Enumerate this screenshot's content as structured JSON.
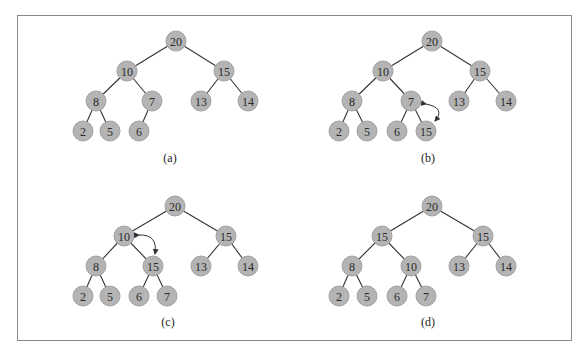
{
  "figure": {
    "panels": [
      {
        "label": "(a)",
        "nodes": [
          {
            "id": "r",
            "value": "20",
            "x": 176,
            "y": 41
          },
          {
            "id": "l",
            "value": "10",
            "x": 127,
            "y": 71
          },
          {
            "id": "r2",
            "value": "15",
            "x": 224,
            "y": 71
          },
          {
            "id": "ll",
            "value": "8",
            "x": 96,
            "y": 101
          },
          {
            "id": "lr",
            "value": "7",
            "x": 152,
            "y": 101
          },
          {
            "id": "rl",
            "value": "13",
            "x": 201,
            "y": 101
          },
          {
            "id": "rr",
            "value": "14",
            "x": 248,
            "y": 101
          },
          {
            "id": "lll",
            "value": "2",
            "x": 83,
            "y": 131
          },
          {
            "id": "llr",
            "value": "5",
            "x": 110,
            "y": 131
          },
          {
            "id": "lrl",
            "value": "6",
            "x": 139,
            "y": 131
          }
        ],
        "edges": [
          [
            "r",
            "l"
          ],
          [
            "r",
            "r2"
          ],
          [
            "l",
            "ll"
          ],
          [
            "l",
            "lr"
          ],
          [
            "r2",
            "rl"
          ],
          [
            "r2",
            "rr"
          ],
          [
            "ll",
            "lll"
          ],
          [
            "ll",
            "llr"
          ],
          [
            "lr",
            "lrl"
          ]
        ],
        "caption_pos": {
          "x": 170,
          "y": 162
        },
        "swap_arrow": null
      },
      {
        "label": "(b)",
        "nodes": [
          {
            "id": "r",
            "value": "20",
            "x": 432,
            "y": 41
          },
          {
            "id": "l",
            "value": "10",
            "x": 383,
            "y": 71
          },
          {
            "id": "r2",
            "value": "15",
            "x": 480,
            "y": 71
          },
          {
            "id": "ll",
            "value": "8",
            "x": 352,
            "y": 101
          },
          {
            "id": "lr",
            "value": "7",
            "x": 411,
            "y": 101
          },
          {
            "id": "rl",
            "value": "13",
            "x": 459,
            "y": 101
          },
          {
            "id": "rr",
            "value": "14",
            "x": 506,
            "y": 101
          },
          {
            "id": "lll",
            "value": "2",
            "x": 339,
            "y": 131
          },
          {
            "id": "llr",
            "value": "5",
            "x": 367,
            "y": 131
          },
          {
            "id": "lrl",
            "value": "6",
            "x": 397,
            "y": 131
          },
          {
            "id": "lrr",
            "value": "15",
            "x": 426,
            "y": 131
          }
        ],
        "edges": [
          [
            "r",
            "l"
          ],
          [
            "r",
            "r2"
          ],
          [
            "l",
            "ll"
          ],
          [
            "l",
            "lr"
          ],
          [
            "r2",
            "rl"
          ],
          [
            "r2",
            "rr"
          ],
          [
            "ll",
            "lll"
          ],
          [
            "ll",
            "llr"
          ],
          [
            "lr",
            "lrl"
          ],
          [
            "lr",
            "lrr"
          ]
        ],
        "caption_pos": {
          "x": 428,
          "y": 162
        },
        "swap_arrow": {
          "x1": 426,
          "y1": 104,
          "x2": 435,
          "y2": 121,
          "cx": 446,
          "cy": 108
        }
      },
      {
        "label": "(c)",
        "nodes": [
          {
            "id": "r",
            "value": "20",
            "x": 175,
            "y": 206
          },
          {
            "id": "l",
            "value": "10",
            "x": 124,
            "y": 236
          },
          {
            "id": "r2",
            "value": "15",
            "x": 226,
            "y": 236
          },
          {
            "id": "ll",
            "value": "8",
            "x": 96,
            "y": 266
          },
          {
            "id": "lr",
            "value": "15",
            "x": 153,
            "y": 266
          },
          {
            "id": "rl",
            "value": "13",
            "x": 201,
            "y": 266
          },
          {
            "id": "rr",
            "value": "14",
            "x": 248,
            "y": 266
          },
          {
            "id": "lll",
            "value": "2",
            "x": 83,
            "y": 296
          },
          {
            "id": "llr",
            "value": "5",
            "x": 110,
            "y": 296
          },
          {
            "id": "lrl",
            "value": "6",
            "x": 139,
            "y": 296
          },
          {
            "id": "lrr",
            "value": "7",
            "x": 167,
            "y": 296
          }
        ],
        "edges": [
          [
            "r",
            "l"
          ],
          [
            "r",
            "r2"
          ],
          [
            "l",
            "ll"
          ],
          [
            "l",
            "lr"
          ],
          [
            "r2",
            "rl"
          ],
          [
            "r2",
            "rr"
          ],
          [
            "ll",
            "lll"
          ],
          [
            "ll",
            "llr"
          ],
          [
            "lr",
            "lrl"
          ],
          [
            "lr",
            "lrr"
          ]
        ],
        "caption_pos": {
          "x": 168,
          "y": 326
        },
        "swap_arrow": {
          "x1": 139,
          "y1": 235,
          "x2": 155,
          "y2": 254,
          "cx": 158,
          "cy": 234
        }
      },
      {
        "label": "(d)",
        "nodes": [
          {
            "id": "r",
            "value": "20",
            "x": 432,
            "y": 206
          },
          {
            "id": "l",
            "value": "15",
            "x": 382,
            "y": 236
          },
          {
            "id": "r2",
            "value": "15",
            "x": 483,
            "y": 236
          },
          {
            "id": "ll",
            "value": "8",
            "x": 352,
            "y": 266
          },
          {
            "id": "lr",
            "value": "10",
            "x": 411,
            "y": 266
          },
          {
            "id": "rl",
            "value": "13",
            "x": 459,
            "y": 266
          },
          {
            "id": "rr",
            "value": "14",
            "x": 506,
            "y": 266
          },
          {
            "id": "lll",
            "value": "2",
            "x": 339,
            "y": 296
          },
          {
            "id": "llr",
            "value": "5",
            "x": 367,
            "y": 296
          },
          {
            "id": "lrl",
            "value": "6",
            "x": 397,
            "y": 296
          },
          {
            "id": "lrr",
            "value": "7",
            "x": 426,
            "y": 296
          }
        ],
        "edges": [
          [
            "r",
            "l"
          ],
          [
            "r",
            "r2"
          ],
          [
            "l",
            "ll"
          ],
          [
            "l",
            "lr"
          ],
          [
            "r2",
            "rl"
          ],
          [
            "r2",
            "rr"
          ],
          [
            "ll",
            "lll"
          ],
          [
            "ll",
            "llr"
          ],
          [
            "lr",
            "lrl"
          ],
          [
            "lr",
            "lrr"
          ]
        ],
        "caption_pos": {
          "x": 428,
          "y": 326
        },
        "swap_arrow": null
      }
    ]
  },
  "colors": {
    "node_fill": "#b4b4b4",
    "edge": "#333333",
    "border": "#8a8a8a"
  },
  "node_radius": 10
}
